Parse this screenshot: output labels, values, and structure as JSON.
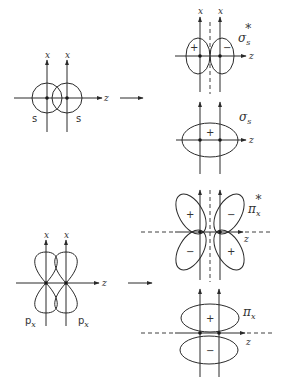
{
  "figure": {
    "arrow": "→",
    "axis_labels": {
      "x": "x",
      "z": "z"
    },
    "atomic_orbitals": {
      "s_pair": {
        "left_label": "s",
        "right_label": "s"
      },
      "px_pair": {
        "left_label": "p",
        "left_sub": "x",
        "right_label": "p",
        "right_sub": "x"
      }
    },
    "molecular_orbitals": {
      "sigma_s_star": {
        "symbol": "σ",
        "sub": "s",
        "sup": "*",
        "lobe_signs": [
          "+",
          "−"
        ]
      },
      "sigma_s": {
        "symbol": "σ",
        "sub": "s",
        "lobe_signs": [
          "+"
        ]
      },
      "pi_x_star": {
        "symbol": "π",
        "sub": "x",
        "sup": "*",
        "lobe_signs": [
          "+",
          "−",
          "−",
          "+"
        ]
      },
      "pi_x": {
        "symbol": "π",
        "sub": "x",
        "lobe_signs": [
          "+",
          "−"
        ]
      }
    },
    "colors": {
      "line": "#2a2a2a",
      "background": "#ffffff"
    }
  }
}
